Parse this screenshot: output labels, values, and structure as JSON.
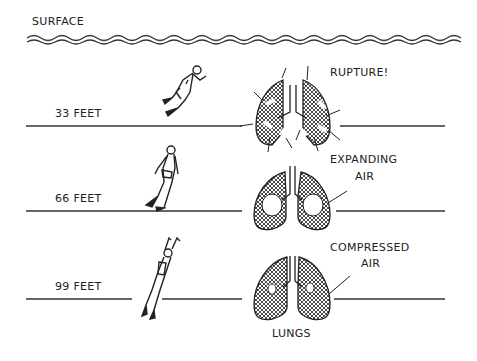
{
  "diagram": {
    "surface_label": "SURFACE",
    "depths": [
      {
        "label": "33 FEET",
        "callout": "RUPTURE!",
        "state": "ruptured lungs"
      },
      {
        "label": "66 FEET",
        "callout_line1": "EXPANDING",
        "callout_line2": "AIR",
        "state": "expanding air"
      },
      {
        "label": "99 FEET",
        "callout_line1": "COMPRESSED",
        "callout_line2": "AIR",
        "state": "compressed air"
      }
    ],
    "lungs_label": "LUNGS"
  },
  "colors": {
    "ink": "#222222",
    "background": "#ffffff"
  }
}
